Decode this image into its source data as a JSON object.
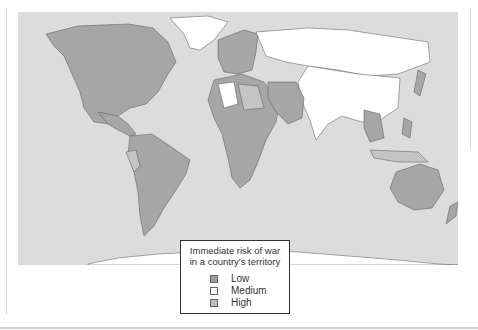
{
  "legend": {
    "title_line1": "Immediate risk of war",
    "title_line2": "in a country's territory",
    "items": [
      {
        "label": "Low",
        "color": "#9c9c9c"
      },
      {
        "label": "Medium",
        "color": "#ffffff"
      },
      {
        "label": "High",
        "color": "#bdbdbd"
      }
    ]
  },
  "colors": {
    "ocean": "#dcdcdc",
    "low": "#a6a6a6",
    "medium": "#ffffff",
    "high": "#c4c4c4",
    "border": "#555555"
  }
}
